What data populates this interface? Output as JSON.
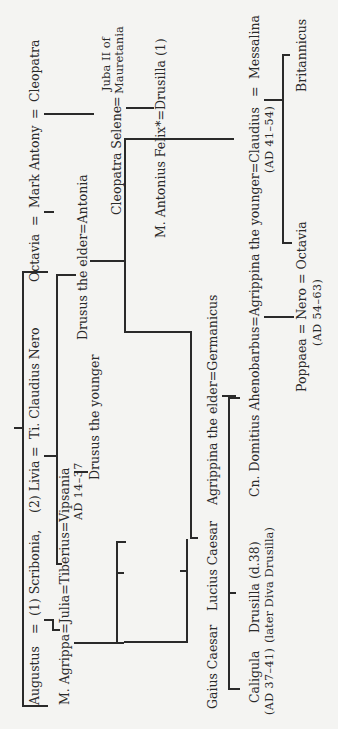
{
  "generation1": {
    "augustus": "Augustus",
    "eq1": "=",
    "scribonia": "(1) Scribonia,",
    "livia": "(2) Livia",
    "eq2": "=",
    "ti_claudius_nero": "Ti. Claudius Nero",
    "octavia": "Octavia",
    "eq3": "=",
    "mark_antony": "Mark Antony",
    "eq4": "=",
    "cleopatra": "Cleopatra"
  },
  "generation2": {
    "agrippa_line": "M. Agrippa=Julia=Tiberius=Vipsania",
    "tiberius_reign": "AD 14–37",
    "drusus_elder_line": "Drusus the elder=Antonia",
    "cleopatra_selene": "Cleopatra Selene",
    "eq": "=",
    "juba_line1": "Juba II of",
    "juba_line2": "Mauretania"
  },
  "generation3": {
    "drusus_younger": "Drusus the younger",
    "felix_line": "M. Antonius Felix*=Drusilla (1)",
    "gaius_caesar": "Gaius Caesar",
    "lucius_caesar": "Lucius Caesar",
    "agrippina_elder_line": "Agrippina the elder=Germanicus"
  },
  "generation4": {
    "caligula": "Caligula",
    "caligula_reign": "(AD 37–41)",
    "drusilla": "Drusilla (d.38)",
    "drusilla_note": "(later Diva Drusilla)",
    "claudius_line": "Cn. Domitius Ahenobarbus=Agrippina the younger=Claudius",
    "eq": "=",
    "messalina": "Messalina",
    "claudius_reign": "(AD 41–54)"
  },
  "generation5": {
    "nero_line": "Poppaea = Nero = Octavia",
    "nero_reign": "(AD 54–63)",
    "britannicus": "Britannicus"
  }
}
